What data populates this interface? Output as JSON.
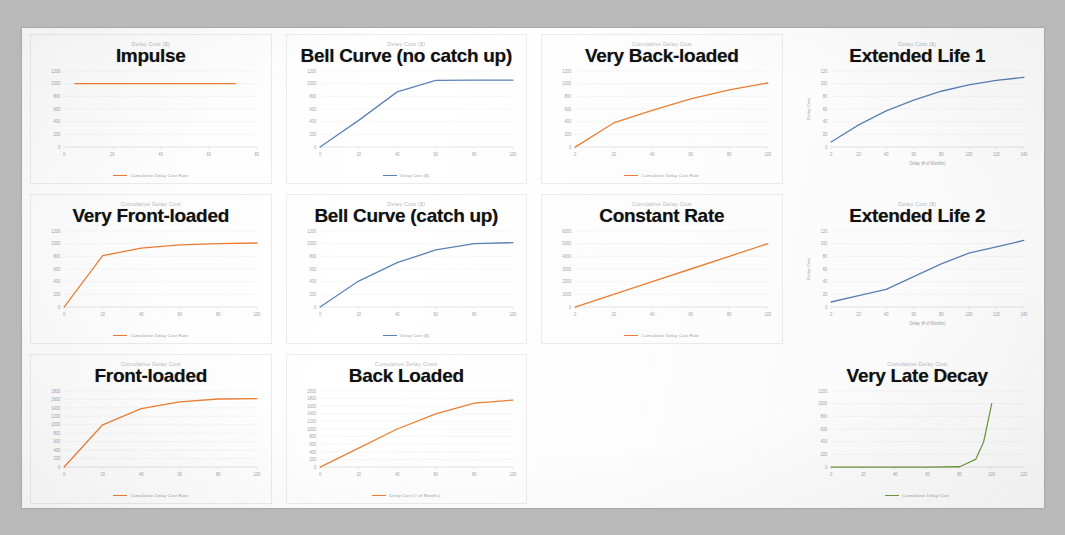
{
  "page": {
    "background_color": "#b9b9b9",
    "sheet_color": "#ffffff",
    "kind": "scanned-slide-of-charts"
  },
  "colors": {
    "orange": "#ED7D31",
    "blue": "#5B7FB4",
    "green": "#6E9B3E",
    "axis_text": "#a0a4a8",
    "overlay_text": "#111111"
  },
  "charts": [
    {
      "overlay_title": "Impulse",
      "chart_data": {
        "type": "line",
        "title": "Delay Cost ($)",
        "xlabel": "",
        "ylabel": "",
        "series": [
          {
            "name": "Cumulative Delay Cost Rate",
            "color": "#ED7D31",
            "x": [
              5,
              20,
              40,
              60,
              80
            ],
            "values": [
              1000,
              1000,
              1000,
              1000,
              1000
            ]
          }
        ],
        "xticks": [
          "0",
          "20",
          "40",
          "60",
          "80"
        ],
        "yticks": [
          "1200",
          "1000",
          "800",
          "600",
          "400",
          "200",
          "0"
        ],
        "xlim": [
          0,
          90
        ],
        "ylim": [
          0,
          1200
        ],
        "legend": [
          "Cumulative Delay Cost Rate"
        ],
        "legend_position": "bottom",
        "grid": false
      }
    },
    {
      "overlay_title": "Bell Curve (no catch up)",
      "chart_data": {
        "type": "line",
        "title": "Delay Cost ($)",
        "xlabel": "",
        "ylabel": "",
        "series": [
          {
            "name": "Delay Cost ($)",
            "color": "#5B7FB4",
            "x": [
              0,
              20,
              40,
              60,
              80,
              100
            ],
            "values": [
              0,
              420,
              870,
              1050,
              1055,
              1055
            ]
          }
        ],
        "xticks": [
          "0",
          "20",
          "40",
          "60",
          "80",
          "100"
        ],
        "yticks": [
          "1200",
          "1000",
          "800",
          "600",
          "400",
          "200",
          "0"
        ],
        "xlim": [
          0,
          100
        ],
        "ylim": [
          0,
          1200
        ],
        "legend": [
          "Delay Cost ($)"
        ],
        "legend_position": "bottom",
        "grid": false
      }
    },
    {
      "overlay_title": "Very Back-loaded",
      "chart_data": {
        "type": "line",
        "title": "Cumulative Delay Cost",
        "xlabel": "",
        "ylabel": "",
        "series": [
          {
            "name": "Cumulative Delay Cost Rate",
            "color": "#ED7D31",
            "x": [
              0,
              20,
              40,
              60,
              80,
              100
            ],
            "values": [
              0,
              380,
              580,
              760,
              900,
              1010
            ]
          }
        ],
        "xticks": [
          "0",
          "20",
          "40",
          "60",
          "80",
          "100"
        ],
        "yticks": [
          "1200",
          "1000",
          "800",
          "600",
          "400",
          "200",
          "0"
        ],
        "xlim": [
          0,
          100
        ],
        "ylim": [
          0,
          1200
        ],
        "legend": [
          "Cumulative Delay Cost Rate"
        ],
        "legend_position": "bottom",
        "grid": false
      }
    },
    {
      "overlay_title": "Extended Life 1",
      "chart_data": {
        "type": "line",
        "title": "Delay Cost ($)",
        "xlabel": "Delay (# of Months)",
        "ylabel": "Delay Cost",
        "series": [
          {
            "name": "",
            "color": "#5B7FB4",
            "x": [
              0,
              20,
              40,
              60,
              80,
              100,
              120,
              140
            ],
            "values": [
              8,
              35,
              57,
              74,
              88,
              98,
              105,
              110
            ]
          }
        ],
        "xticks": [
          "0",
          "20",
          "40",
          "60",
          "80",
          "100",
          "120",
          "140"
        ],
        "yticks": [
          "120",
          "100",
          "80",
          "60",
          "40",
          "20",
          "0"
        ],
        "xlim": [
          0,
          140
        ],
        "ylim": [
          0,
          120
        ],
        "legend": [],
        "legend_position": "none",
        "grid": false
      }
    },
    {
      "overlay_title": "Very Front-loaded",
      "chart_data": {
        "type": "line",
        "title": "Cumulative Delay Cost",
        "xlabel": "",
        "ylabel": "",
        "series": [
          {
            "name": "Cumulative Delay Cost Rate",
            "color": "#ED7D31",
            "x": [
              0,
              20,
              40,
              60,
              80,
              100
            ],
            "values": [
              0,
              810,
              930,
              980,
              1000,
              1010
            ]
          }
        ],
        "xticks": [
          "0",
          "20",
          "40",
          "60",
          "80",
          "100"
        ],
        "yticks": [
          "1200",
          "1000",
          "800",
          "600",
          "400",
          "200",
          "0"
        ],
        "xlim": [
          0,
          100
        ],
        "ylim": [
          0,
          1200
        ],
        "legend": [
          "Cumulative Delay Cost Rate"
        ],
        "legend_position": "bottom",
        "grid": false
      }
    },
    {
      "overlay_title": "Bell Curve (catch up)",
      "chart_data": {
        "type": "line",
        "title": "Delay Cost ($)",
        "xlabel": "",
        "ylabel": "",
        "series": [
          {
            "name": "Delay Cost ($)",
            "color": "#5B7FB4",
            "x": [
              0,
              20,
              40,
              60,
              80,
              100
            ],
            "values": [
              0,
              410,
              700,
              900,
              1000,
              1015
            ]
          }
        ],
        "xticks": [
          "0",
          "20",
          "40",
          "60",
          "80",
          "100"
        ],
        "yticks": [
          "1200",
          "1000",
          "800",
          "600",
          "400",
          "200",
          "0"
        ],
        "xlim": [
          0,
          100
        ],
        "ylim": [
          0,
          1200
        ],
        "legend": [
          "Delay Cost ($)"
        ],
        "legend_position": "bottom",
        "grid": false
      }
    },
    {
      "overlay_title": "Constant Rate",
      "chart_data": {
        "type": "line",
        "title": "Cumulative Delay Cost",
        "xlabel": "",
        "ylabel": "",
        "series": [
          {
            "name": "Cumulative Delay Cost Rate",
            "color": "#ED7D31",
            "x": [
              0,
              20,
              40,
              60,
              80,
              100
            ],
            "values": [
              0,
              1000,
              2000,
              3000,
              4000,
              5000
            ]
          }
        ],
        "xticks": [
          "0",
          "20",
          "40",
          "60",
          "80",
          "100"
        ],
        "yticks": [
          "6000",
          "5000",
          "4000",
          "3000",
          "2000",
          "1000",
          "0"
        ],
        "xlim": [
          0,
          100
        ],
        "ylim": [
          0,
          6000
        ],
        "legend": [
          "Cumulative Delay Cost Rate"
        ],
        "legend_position": "bottom",
        "grid": false
      }
    },
    {
      "overlay_title": "Extended Life 2",
      "chart_data": {
        "type": "line",
        "title": "Delay Cost ($)",
        "xlabel": "Delay (# of Months)",
        "ylabel": "Delay Cost",
        "series": [
          {
            "name": "",
            "color": "#5B7FB4",
            "x": [
              0,
              20,
              40,
              60,
              80,
              100,
              120,
              140
            ],
            "values": [
              8,
              18,
              28,
              48,
              68,
              85,
              95,
              105
            ]
          }
        ],
        "xticks": [
          "0",
          "20",
          "40",
          "60",
          "80",
          "100",
          "120",
          "140"
        ],
        "yticks": [
          "120",
          "100",
          "80",
          "60",
          "40",
          "20",
          "0"
        ],
        "xlim": [
          0,
          140
        ],
        "ylim": [
          0,
          120
        ],
        "legend": [],
        "legend_position": "none",
        "grid": false
      }
    },
    {
      "overlay_title": "Front-loaded",
      "chart_data": {
        "type": "line",
        "title": "Cumulative Delay Cost",
        "xlabel": "",
        "ylabel": "",
        "series": [
          {
            "name": "Cumulative Delay Cost Rate",
            "color": "#ED7D31",
            "x": [
              0,
              20,
              40,
              60,
              80,
              100
            ],
            "values": [
              0,
              1000,
              1380,
              1540,
              1610,
              1620
            ]
          }
        ],
        "xticks": [
          "0",
          "20",
          "40",
          "60",
          "80",
          "100"
        ],
        "yticks": [
          "1800",
          "1600",
          "1400",
          "1200",
          "1000",
          "800",
          "600",
          "400",
          "200",
          "0"
        ],
        "xlim": [
          0,
          100
        ],
        "ylim": [
          0,
          1800
        ],
        "legend": [
          "Cumulative Delay Cost Rate"
        ],
        "legend_position": "bottom",
        "grid": false
      }
    },
    {
      "overlay_title": "Back Loaded",
      "chart_data": {
        "type": "line",
        "title": "Cumulative Delay Costs",
        "xlabel": "",
        "ylabel": "",
        "series": [
          {
            "name": "Delay Cost (# of Months)",
            "color": "#ED7D31",
            "x": [
              0,
              20,
              40,
              60,
              80,
              100
            ],
            "values": [
              0,
              500,
              1000,
              1400,
              1680,
              1760
            ]
          }
        ],
        "xticks": [
          "0",
          "20",
          "40",
          "60",
          "80",
          "100"
        ],
        "yticks": [
          "2000",
          "1800",
          "1600",
          "1400",
          "1200",
          "1000",
          "800",
          "600",
          "400",
          "200",
          "0"
        ],
        "xlim": [
          0,
          100
        ],
        "ylim": [
          0,
          2000
        ],
        "legend": [
          "Delay Cost (# of Months)"
        ],
        "legend_position": "bottom",
        "grid": false
      }
    },
    {
      "overlay_title": "Very Late Decay",
      "chart_data": {
        "type": "line",
        "title": "Cumulative Delay Cost",
        "xlabel": "",
        "ylabel": "",
        "series": [
          {
            "name": "Cumulative Delay Cost",
            "color": "#6E9B3E",
            "x": [
              0,
              20,
              40,
              60,
              80,
              90,
              95,
              100
            ],
            "values": [
              0,
              0,
              0,
              0,
              5,
              120,
              400,
              1000
            ]
          }
        ],
        "xticks": [
          "0",
          "20",
          "40",
          "60",
          "80",
          "100",
          "120"
        ],
        "yticks": [
          "1200",
          "1000",
          "800",
          "600",
          "400",
          "200",
          "0"
        ],
        "xlim": [
          0,
          120
        ],
        "ylim": [
          0,
          1200
        ],
        "legend": [
          "Cumulative Delay Cost"
        ],
        "legend_position": "bottom",
        "grid": false
      }
    }
  ],
  "empty_cell_index": 10
}
